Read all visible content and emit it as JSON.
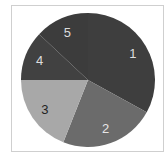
{
  "chart_data": {
    "type": "pie",
    "title": "",
    "categories": [
      "1",
      "2",
      "3",
      "4",
      "5"
    ],
    "values": [
      33,
      23,
      19,
      12,
      13
    ],
    "unit": "percent (estimated from slice angles)",
    "start_angle": "12 o'clock, clockwise",
    "colors": [
      "#3e3e3e",
      "#6b6b6b",
      "#a8a8a8",
      "#414141",
      "#3c3c3c"
    ],
    "label_colors": [
      "#dddddd",
      "#e6e6e6",
      "#222222",
      "#dddddd",
      "#dddddd"
    ],
    "legend": "none",
    "frame_border_color": "#cfcfcf"
  }
}
